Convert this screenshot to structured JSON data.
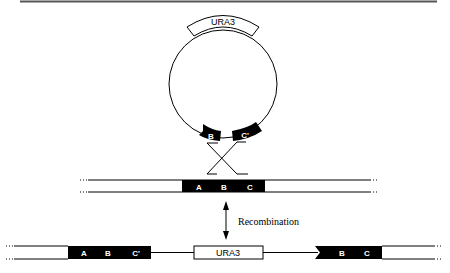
{
  "plasmid": {
    "marker_label": "URA3",
    "segment_left_label": "B",
    "segment_right_label": "C'"
  },
  "chromosome": {
    "block_labels": [
      "A",
      "B",
      "C"
    ]
  },
  "arrow": {
    "label": "Recombination"
  },
  "product": {
    "left_block_labels": [
      "A",
      "B",
      "C'"
    ],
    "marker_label": "URA3",
    "right_block_labels": [
      "B",
      "C"
    ]
  },
  "colors": {
    "ink": "#000000",
    "rule": "#555555",
    "background": "#ffffff"
  }
}
